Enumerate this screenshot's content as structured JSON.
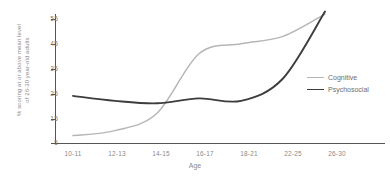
{
  "chart_data": {
    "type": "line",
    "title": "",
    "xlabel": "Age",
    "ylabel_line1": "% scoring at or above mean level",
    "ylabel_line2": "of 26-30 year-old adults",
    "categories": [
      "10-11",
      "12-13",
      "14-15",
      "16-17",
      "18-21",
      "22-25",
      "26-30"
    ],
    "xtick_labels": [
      "10-11",
      "12-13",
      "14-15",
      "16-17",
      "18-21",
      "22-25",
      "26-30"
    ],
    "ytick_labels": [
      "5",
      "15",
      "25",
      "35",
      "45",
      "55"
    ],
    "ytick_values": [
      5,
      15,
      25,
      35,
      45,
      55
    ],
    "ylim": [
      5,
      60
    ],
    "grid": false,
    "legend_position": "right-middle",
    "series": [
      {
        "name": "Cognitive",
        "color": "#b6b6b6",
        "values": [
          8,
          10,
          17,
          41,
          45,
          48,
          57
        ]
      },
      {
        "name": "Psychosocial",
        "color": "#3d3d3d",
        "values": [
          24,
          22,
          21,
          23,
          22,
          31,
          58
        ]
      }
    ]
  },
  "legend": {
    "items": [
      {
        "label": "Cognitive",
        "color": "#b6b6b6"
      },
      {
        "label": "Psychosocial",
        "color": "#3d3d3d"
      }
    ]
  },
  "axis_colors": {
    "axis_line": "#555555",
    "tick_label": "#8a8a8a"
  }
}
